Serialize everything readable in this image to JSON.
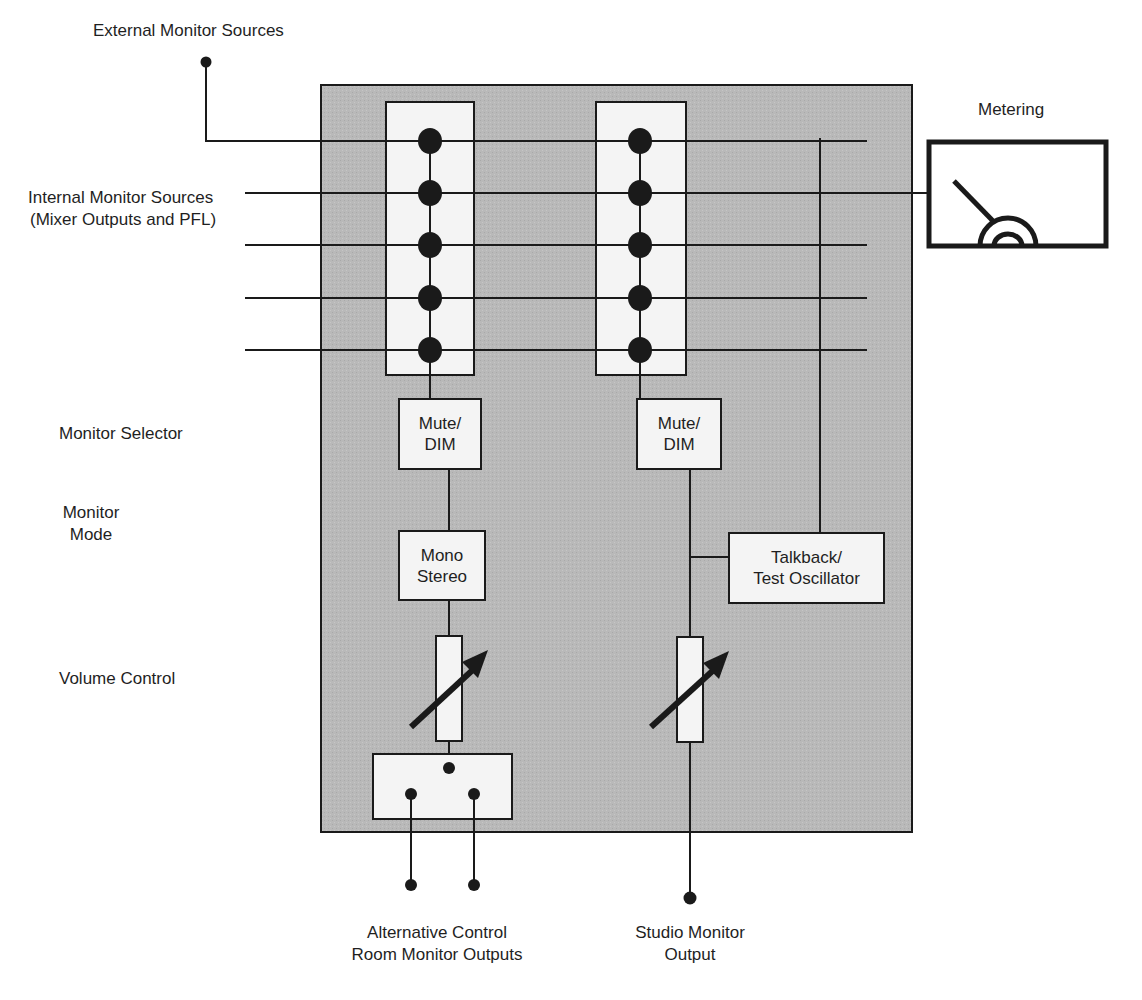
{
  "diagram": {
    "type": "block-diagram",
    "colors": {
      "panel_fill": "#b9b9b9",
      "box_fill": "#f4f4f4",
      "line": "#1a1a1a",
      "background": "#ffffff"
    }
  },
  "labels": {
    "external_sources": "External Monitor Sources",
    "internal_sources_line1": "Internal Monitor Sources",
    "internal_sources_line2": "(Mixer Outputs and PFL)",
    "metering": "Metering",
    "monitor_selector": "Monitor Selector",
    "monitor_mode_line1": "Monitor",
    "monitor_mode_line2": "Mode",
    "volume_control": "Volume Control",
    "alt_outputs_line1": "Alternative Control",
    "alt_outputs_line2": "Room Monitor Outputs",
    "studio_output_line1": "Studio Monitor",
    "studio_output_line2": "Output"
  },
  "blocks": {
    "mute_dim_a_line1": "Mute/",
    "mute_dim_a_line2": "DIM",
    "mute_dim_b_line1": "Mute/",
    "mute_dim_b_line2": "DIM",
    "mono_stereo_line1": "Mono",
    "mono_stereo_line2": "Stereo",
    "talkback_line1": "Talkback/",
    "talkback_line2": "Test Oscillator"
  },
  "buses": {
    "count": 5,
    "selectors": 2,
    "nodes_per_selector": 5
  }
}
